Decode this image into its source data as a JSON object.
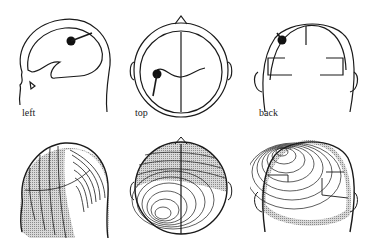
{
  "figure": {
    "top_row": {
      "views": [
        {
          "id": "left",
          "label": "left"
        },
        {
          "id": "top",
          "label": "top"
        },
        {
          "id": "back",
          "label": "back"
        }
      ],
      "description": "Head outlines with brain contour and dipole source (filled dot with orientation line)"
    },
    "bottom_row": {
      "views": [
        {
          "id": "left-map",
          "view": "left"
        },
        {
          "id": "top-map",
          "view": "top"
        },
        {
          "id": "back-map",
          "view": "back"
        }
      ],
      "description": "Scalp potential contour maps; stippled gray = negative, white = positive"
    },
    "colors": {
      "line": "#1a1a1a",
      "stipple": "#9a9a9a",
      "background": "#ffffff"
    }
  }
}
